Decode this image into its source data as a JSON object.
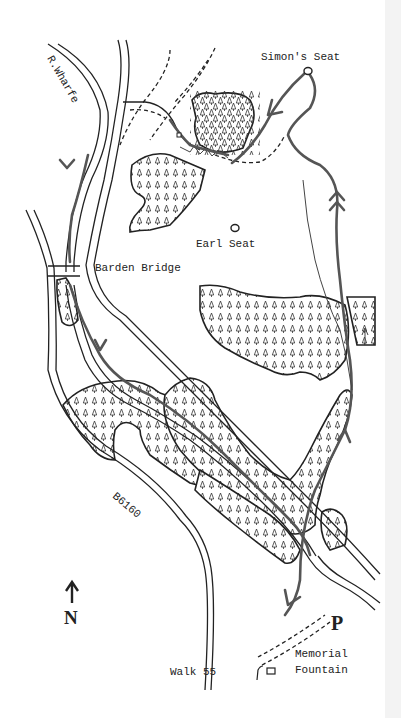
{
  "map": {
    "title": "Walk 55",
    "labels": {
      "river": "R.Wharfe",
      "summit_main": "Simon's Seat",
      "summit_secondary": "Earl Seat",
      "bridge": "Barden Bridge",
      "road": "B6160",
      "start": "Memorial",
      "start_line2": "Fountain",
      "parking": "P",
      "north": "N"
    },
    "legend_symbols": {
      "woodland": "tree-hatch pattern",
      "route": "thick grey line with arrows",
      "footpath": "dashed line",
      "road": "double line",
      "summit": "small circle"
    },
    "colors": {
      "ink": "#222222",
      "route": "#555555",
      "paper": "#ffffff"
    }
  }
}
